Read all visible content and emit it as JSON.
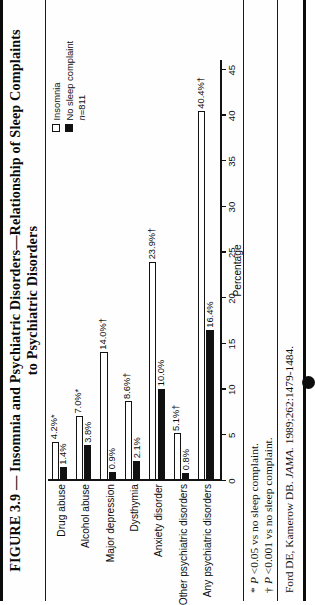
{
  "figure": {
    "title_line_1": "FIGURE 3.9 — Insomnia and Psychiatric Disorders—Relationship of Sleep Complaints",
    "title_line_2": "to Psychiatric Disorders",
    "footnotes": [
      {
        "mark": "*",
        "text": "P <0.05 vs no sleep complaint."
      },
      {
        "mark": "†",
        "text": "P <0.001 vs no sleep complaint."
      }
    ],
    "citation_prefix": "Ford DE, Kamerow DB. ",
    "citation_journal": "JAMA.",
    "citation_suffix": " 1989;262:1479-1484."
  },
  "legend": {
    "items": [
      {
        "label": "Insomnia",
        "swatch": "white"
      },
      {
        "label": "No sleep complaint",
        "swatch": "black"
      }
    ],
    "n_prefix": "n",
    "n_value": "=811"
  },
  "chart_data": {
    "type": "bar",
    "orientation": "horizontal",
    "title": "FIGURE 3.9 — Insomnia and Psychiatric Disorders—Relationship of Sleep Complaints to Psychiatric Disorders",
    "xlabel": "Percentage",
    "ylabel": "",
    "xlim": [
      0,
      46
    ],
    "ticks": [
      0,
      5,
      10,
      15,
      20,
      25,
      30,
      35,
      40,
      45
    ],
    "tick_labels": [
      "0",
      "5",
      "10",
      "15",
      "20",
      "25",
      "30",
      "35",
      "40",
      "45"
    ],
    "grid": false,
    "legend_position": "top-right",
    "categories": [
      "Drug abuse",
      "Alcohol abuse",
      "Major depression",
      "Dysthymia",
      "Anxiety disorder",
      "Other psychiatric disorders",
      "Any psychiatric disorders"
    ],
    "series": [
      {
        "name": "Insomnia",
        "color": "#ffffff",
        "values": [
          4.2,
          7.0,
          14.0,
          8.6,
          23.9,
          5.1,
          40.4
        ],
        "labels": [
          "4.2%*",
          "7.0%*",
          "14.0%†",
          "8.6%†",
          "23.9%†",
          "5.1%†",
          "40.4%†"
        ]
      },
      {
        "name": "No sleep complaint",
        "color": "#111111",
        "values": [
          1.4,
          3.8,
          0.9,
          2.1,
          10.0,
          0.8,
          16.4
        ],
        "labels": [
          "1.4%",
          "3.8%",
          "0.9%",
          "2.1%",
          "10.0%",
          "0.8%",
          "16.4%"
        ]
      }
    ],
    "n": 811,
    "annotations": [
      "* P <0.05 vs no sleep complaint.",
      "† P <0.001 vs no sleep complaint."
    ],
    "source": "Ford DE, Kamerow DB. JAMA. 1989;262:1479-1484."
  }
}
